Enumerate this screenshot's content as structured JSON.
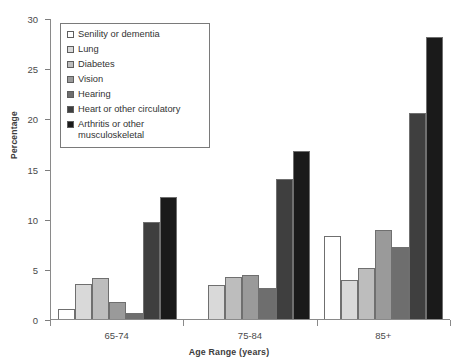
{
  "chart_data": {
    "type": "bar",
    "title": "",
    "xlabel": "Age Range (years)",
    "ylabel": "Percentage",
    "categories": [
      "65-74",
      "75-84",
      "85+"
    ],
    "ylim": [
      0,
      30
    ],
    "yticks": [
      0,
      5,
      10,
      15,
      20,
      25,
      30
    ],
    "grid": false,
    "legend_position": "top-left",
    "series": [
      {
        "name": "Senility or dementia",
        "color": "#ffffff",
        "values": [
          1.0,
          0.0,
          8.3
        ]
      },
      {
        "name": "Lung",
        "color": "#d9d9d9",
        "values": [
          3.5,
          3.4,
          3.9
        ]
      },
      {
        "name": "Diabetes",
        "color": "#bdbdbd",
        "values": [
          4.1,
          4.2,
          5.1
        ]
      },
      {
        "name": "Vision",
        "color": "#9a9a9a",
        "values": [
          1.7,
          4.4,
          8.9
        ]
      },
      {
        "name": "Hearing",
        "color": "#6e6e6e",
        "values": [
          0.6,
          3.1,
          7.2
        ]
      },
      {
        "name": "Heart or other circulatory",
        "color": "#3f3f3f",
        "values": [
          9.7,
          14.0,
          20.5
        ]
      },
      {
        "name": "Arthritis or other\nmusculoskeletal",
        "color": "#1a1a1a",
        "values": [
          12.2,
          16.7,
          28.1
        ]
      }
    ]
  }
}
